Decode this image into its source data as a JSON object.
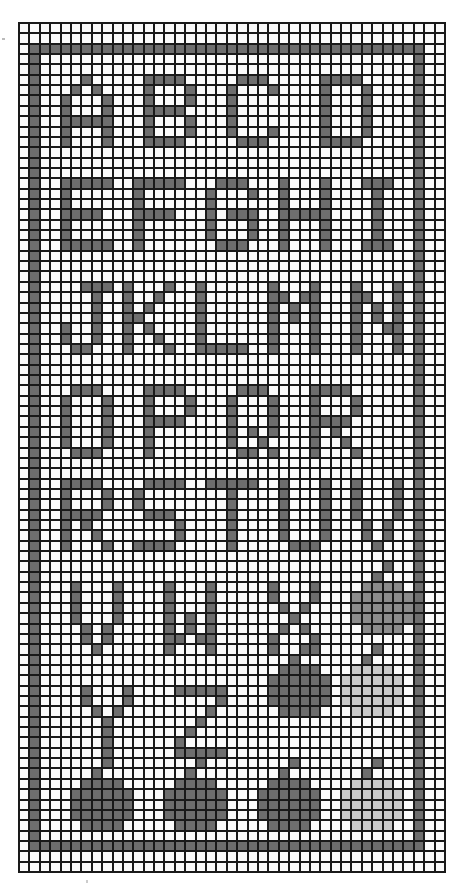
{
  "grid": {
    "columns": 41,
    "rows": 82
  },
  "colors": {
    "grid_line": "#1a1a1a",
    "empty": "#fbfbfb",
    "dark_stitch": "#6e6e6e",
    "medium_stitch": "#8c8c8c",
    "light_stitch": "#c9c9c9"
  },
  "frame": {
    "top_row": 2,
    "bottom_row": 79,
    "left_col": 1,
    "right_col": 38
  },
  "letter_rows": [
    {
      "letters": [
        "A",
        "B",
        "C",
        "D"
      ],
      "top_row": 5,
      "start_cols": [
        4,
        12,
        20,
        29
      ]
    },
    {
      "letters": [
        "E",
        "F",
        "G",
        "H",
        "I"
      ],
      "top_row": 15,
      "start_cols": [
        4,
        11,
        18,
        25,
        33
      ]
    },
    {
      "letters": [
        "J",
        "K",
        "L",
        "M",
        "N"
      ],
      "top_row": 25,
      "start_cols": [
        4,
        10,
        17,
        24,
        32
      ]
    },
    {
      "letters": [
        "O",
        "P",
        "Q",
        "R"
      ],
      "top_row": 35,
      "start_cols": [
        4,
        12,
        20,
        28
      ]
    },
    {
      "letters": [
        "R",
        "S",
        "T",
        "U",
        "V"
      ],
      "top_row": 44,
      "start_cols": [
        4,
        11,
        18,
        25,
        32
      ]
    },
    {
      "letters": [
        "V",
        "W",
        "X"
      ],
      "top_row": 54,
      "start_cols": [
        5,
        14,
        24
      ]
    },
    {
      "letters": [
        "Y",
        "Z"
      ],
      "top_row": 64,
      "start_cols": [
        6,
        15
      ]
    }
  ],
  "motifs": [
    {
      "name": "small-apple",
      "top_row": 52,
      "left_col": 32,
      "shade": "m"
    },
    {
      "name": "large-apple",
      "top_row": 60,
      "left_col": 24,
      "shade": "d"
    },
    {
      "name": "pale-apple",
      "top_row": 60,
      "left_col": 31,
      "shade": "l"
    },
    {
      "name": "bottom-apple",
      "top_row": 71,
      "left_col": 5,
      "shade": "d"
    },
    {
      "name": "bottom-apple",
      "top_row": 71,
      "left_col": 14,
      "shade": "d"
    },
    {
      "name": "bottom-apple",
      "top_row": 71,
      "left_col": 23,
      "shade": "d"
    },
    {
      "name": "bottom-apple",
      "top_row": 71,
      "left_col": 31,
      "shade": "l"
    }
  ]
}
